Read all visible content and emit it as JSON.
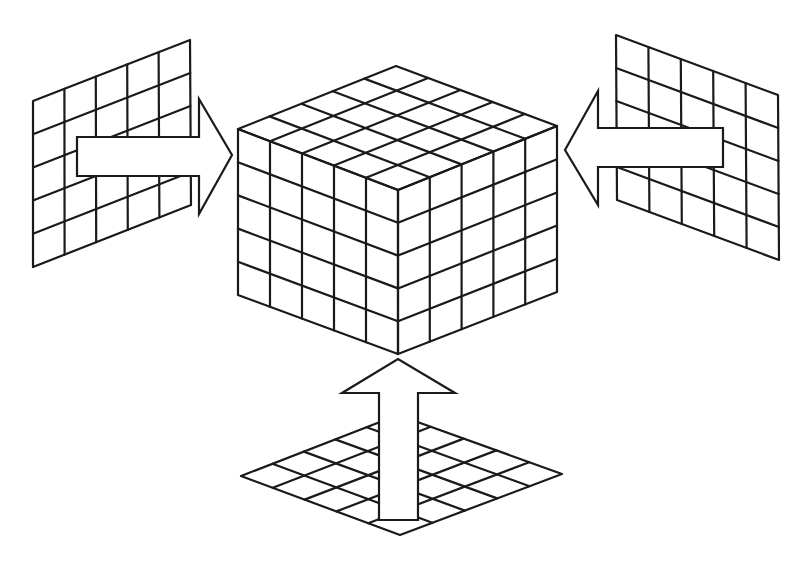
{
  "diagram": {
    "stroke_color": "#1a1a1a",
    "background": "#ffffff",
    "divisions": 5,
    "cube": {
      "top": [
        396,
        66
      ],
      "left_top": [
        238,
        129
      ],
      "right_top": [
        557,
        126
      ],
      "front_top": [
        398,
        190
      ],
      "left_bottom": [
        238,
        295
      ],
      "right_bottom": [
        557,
        292
      ],
      "front_bottom": [
        398,
        354
      ]
    },
    "panels": [
      {
        "name": "left-panel",
        "corners": [
          [
            33,
            101
          ],
          [
            190,
            40
          ],
          [
            191,
            205
          ],
          [
            33,
            267
          ]
        ]
      },
      {
        "name": "right-panel",
        "corners": [
          [
            616,
            35
          ],
          [
            778,
            95
          ],
          [
            779,
            260
          ],
          [
            617,
            200
          ]
        ]
      },
      {
        "name": "bottom-panel",
        "corners": [
          [
            398,
            415
          ],
          [
            562,
            474
          ],
          [
            400,
            535
          ],
          [
            241,
            476
          ]
        ]
      }
    ],
    "arrows": [
      {
        "name": "left-arrow",
        "direction": "right",
        "points": [
          [
            77,
            137
          ],
          [
            199,
            137
          ],
          [
            199,
            99
          ],
          [
            232,
            155
          ],
          [
            199,
            214
          ],
          [
            199,
            176
          ],
          [
            77,
            176
          ]
        ]
      },
      {
        "name": "right-arrow",
        "direction": "left",
        "points": [
          [
            723,
            128
          ],
          [
            598,
            128
          ],
          [
            598,
            91
          ],
          [
            565,
            150
          ],
          [
            598,
            205
          ],
          [
            598,
            167
          ],
          [
            723,
            167
          ]
        ]
      },
      {
        "name": "bottom-arrow",
        "direction": "up",
        "points": [
          [
            379,
            520
          ],
          [
            379,
            393
          ],
          [
            342,
            393
          ],
          [
            398,
            359
          ],
          [
            455,
            393
          ],
          [
            418,
            393
          ],
          [
            418,
            520
          ]
        ]
      }
    ]
  }
}
